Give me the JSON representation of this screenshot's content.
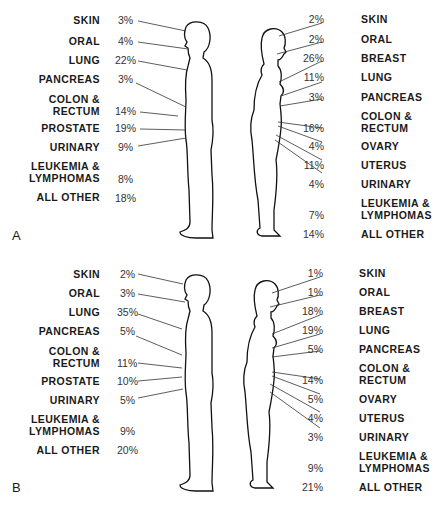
{
  "figure": {
    "panels": [
      {
        "letter": "A",
        "male": [
          {
            "site": "SKIN",
            "pct": "3%"
          },
          {
            "site": "ORAL",
            "pct": "4%"
          },
          {
            "site": "LUNG",
            "pct": "22%"
          },
          {
            "site": "PANCREAS",
            "pct": "3%"
          },
          {
            "site": "COLON &\nRECTUM",
            "pct": "14%"
          },
          {
            "site": "PROSTATE",
            "pct": "19%"
          },
          {
            "site": "URINARY",
            "pct": "9%"
          },
          {
            "site": "LEUKEMIA &\nLYMPHOMAS",
            "pct": "8%"
          },
          {
            "site": "ALL OTHER",
            "pct": "18%"
          }
        ],
        "female": [
          {
            "site": "SKIN",
            "pct": "2%"
          },
          {
            "site": "ORAL",
            "pct": "2%"
          },
          {
            "site": "BREAST",
            "pct": "26%"
          },
          {
            "site": "LUNG",
            "pct": "11%"
          },
          {
            "site": "PANCREAS",
            "pct": "3%"
          },
          {
            "site": "COLON &\nRECTUM",
            "pct": "16%"
          },
          {
            "site": "OVARY",
            "pct": "4%"
          },
          {
            "site": "UTERUS",
            "pct": "11%"
          },
          {
            "site": "URINARY",
            "pct": "4%"
          },
          {
            "site": "LEUKEMIA &\nLYMPHOMAS",
            "pct": "7%"
          },
          {
            "site": "ALL OTHER",
            "pct": "14%"
          }
        ]
      },
      {
        "letter": "B",
        "male": [
          {
            "site": "SKIN",
            "pct": "2%"
          },
          {
            "site": "ORAL",
            "pct": "3%"
          },
          {
            "site": "LUNG",
            "pct": "35%"
          },
          {
            "site": "PANCREAS",
            "pct": "5%"
          },
          {
            "site": "COLON &\nRECTUM",
            "pct": "11%"
          },
          {
            "site": "PROSTATE",
            "pct": "10%"
          },
          {
            "site": "URINARY",
            "pct": "5%"
          },
          {
            "site": "LEUKEMIA &\nLYMPHOMAS",
            "pct": "9%"
          },
          {
            "site": "ALL OTHER",
            "pct": "20%"
          }
        ],
        "female": [
          {
            "site": "SKIN",
            "pct": "1%"
          },
          {
            "site": "ORAL",
            "pct": "1%"
          },
          {
            "site": "BREAST",
            "pct": "18%"
          },
          {
            "site": "LUNG",
            "pct": "19%"
          },
          {
            "site": "PANCREAS",
            "pct": "5%"
          },
          {
            "site": "COLON &\nRECTUM",
            "pct": "14%"
          },
          {
            "site": "OVARY",
            "pct": "5%"
          },
          {
            "site": "UTERUS",
            "pct": "4%"
          },
          {
            "site": "URINARY",
            "pct": "3%"
          },
          {
            "site": "LEUKEMIA &\nLYMPHOMAS",
            "pct": "9%"
          },
          {
            "site": "ALL OTHER",
            "pct": "21%"
          }
        ]
      }
    ]
  }
}
